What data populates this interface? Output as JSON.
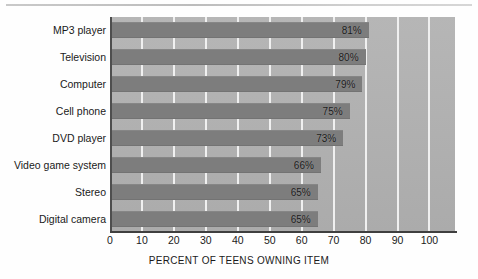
{
  "chart_data": {
    "type": "bar",
    "orientation": "horizontal",
    "title": "",
    "subtitle": "",
    "xlabel": "PERCENT OF TEENS OWNING ITEM",
    "ylabel": "",
    "categories": [
      "MP3 player",
      "Television",
      "Computer",
      "Cell phone",
      "DVD player",
      "Video game system",
      "Stereo",
      "Digital camera"
    ],
    "values": [
      81,
      80,
      79,
      75,
      73,
      66,
      65,
      65
    ],
    "data_labels": [
      "81%",
      "80%",
      "79%",
      "75%",
      "73%",
      "66%",
      "65%",
      "65%"
    ],
    "xlim": [
      0,
      108
    ],
    "xticks": [
      0,
      10,
      20,
      30,
      40,
      50,
      60,
      70,
      80,
      90,
      100
    ],
    "xtick_labels": [
      "0",
      "10",
      "20",
      "30",
      "40",
      "50",
      "60",
      "70",
      "80",
      "90",
      "100"
    ],
    "grid": "vertical-white",
    "legend": "none",
    "bar_color": "#7d7d7d",
    "plot_background": "#b2b2b2",
    "gridline_color": "#f0f0f0",
    "axis_color": "#3f3f3f",
    "label_color": "#1a1a1a"
  },
  "footer": {
    "source_note": ""
  }
}
